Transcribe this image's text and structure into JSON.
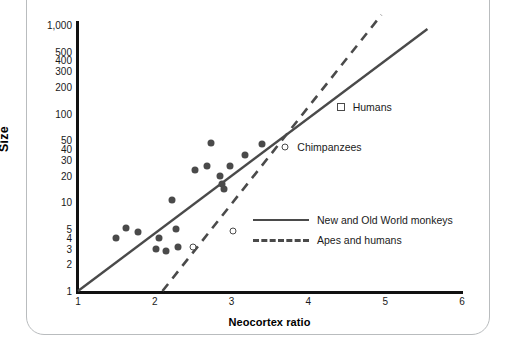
{
  "figure": {
    "frame_color": "#b9bcbe",
    "marker_color": "#4a4a4a",
    "axis_color": "#111111"
  },
  "chart_data": {
    "type": "scatter",
    "title": "",
    "xlabel": "Neocortex ratio",
    "ylabel": "Size",
    "xlim": [
      1,
      6
    ],
    "ylim": [
      1,
      1000
    ],
    "yscale": "log",
    "xscale": "linear",
    "grid": false,
    "legend_position": "center-right",
    "xticks": [
      1,
      2,
      3,
      4,
      5,
      6
    ],
    "xtick_labels": [
      "1",
      "2",
      "3",
      "4",
      "5",
      "6"
    ],
    "yticks": [
      1,
      2,
      3,
      4,
      5,
      10,
      20,
      30,
      40,
      50,
      100,
      200,
      300,
      400,
      500,
      1000
    ],
    "ytick_labels": [
      "1",
      "2",
      "3",
      "4",
      "5",
      "10",
      "20",
      "30",
      "40",
      "50",
      "100",
      "200",
      "300",
      "400",
      "500",
      "1,000"
    ],
    "series": [
      {
        "name": "New and Old World monkeys",
        "marker": "filled-circle",
        "color": "#4a4a4a",
        "points": [
          {
            "x": 1.5,
            "y": 4.0
          },
          {
            "x": 1.62,
            "y": 5.2
          },
          {
            "x": 1.78,
            "y": 4.6
          },
          {
            "x": 2.05,
            "y": 4.0
          },
          {
            "x": 2.02,
            "y": 3.0
          },
          {
            "x": 2.15,
            "y": 2.8
          },
          {
            "x": 2.22,
            "y": 10.5
          },
          {
            "x": 2.28,
            "y": 5.0
          },
          {
            "x": 2.3,
            "y": 3.1
          },
          {
            "x": 2.52,
            "y": 23.0
          },
          {
            "x": 2.68,
            "y": 26.0
          },
          {
            "x": 2.73,
            "y": 47.0
          },
          {
            "x": 2.85,
            "y": 20.0
          },
          {
            "x": 2.88,
            "y": 16.0
          },
          {
            "x": 2.9,
            "y": 14.0
          },
          {
            "x": 2.98,
            "y": 26.0
          },
          {
            "x": 3.18,
            "y": 34.0
          },
          {
            "x": 3.4,
            "y": 45.0
          }
        ]
      },
      {
        "name": "Apes and humans",
        "marker": "open-circle",
        "color": "#4a4a4a",
        "points": [
          {
            "x": 2.5,
            "y": 3.1
          },
          {
            "x": 3.02,
            "y": 4.8
          },
          {
            "x": 3.7,
            "y": 42.0
          }
        ]
      },
      {
        "name": "Humans",
        "marker": "open-square",
        "color": "#4a4a4a",
        "points": [
          {
            "x": 4.42,
            "y": 120.0
          }
        ]
      }
    ],
    "trendlines": [
      {
        "name": "New and Old World monkeys",
        "style": "solid",
        "color": "#4a4a4a",
        "from": {
          "x": 1.0,
          "y": 1.0
        },
        "to": {
          "x": 5.55,
          "y": 900.0
        }
      },
      {
        "name": "Apes and humans",
        "style": "dashed",
        "color": "#4a4a4a",
        "from": {
          "x": 2.1,
          "y": 1.0
        },
        "to": {
          "x": 4.95,
          "y": 1300.0
        }
      }
    ],
    "annotations": [
      {
        "label": "Humans",
        "x": 4.42,
        "y": 120.0
      },
      {
        "label": "Chimpanzees",
        "x": 3.7,
        "y": 42.0
      }
    ]
  },
  "legend": {
    "entries": [
      {
        "label": "New and Old World monkeys",
        "style": "solid"
      },
      {
        "label": "Apes and humans",
        "style": "dashed"
      }
    ]
  },
  "annotations": {
    "humans": "Humans",
    "chimpanzees": "Chimpanzees"
  },
  "axes": {
    "x_title": "Neocortex ratio",
    "y_title": "Size"
  }
}
